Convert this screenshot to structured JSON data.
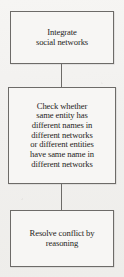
{
  "diagram": {
    "type": "flowchart",
    "orientation": "vertical",
    "background_color": "#f1f0ee",
    "border_color": "#6d6b68",
    "text_color": "#262423",
    "node_fill_color": "#f7f6f4",
    "nodes": [
      {
        "id": "integrate",
        "shape": "rectangle",
        "lines": [
          "Integrate",
          "social networks"
        ]
      },
      {
        "id": "check",
        "shape": "rectangle",
        "lines": [
          "Check whether",
          "same entity has",
          "different names in",
          "different networks",
          "or different entities",
          "have same name in",
          "different networks"
        ]
      },
      {
        "id": "resolve",
        "shape": "rectangle",
        "lines": [
          "Resolve conflict by",
          "reasoning"
        ]
      }
    ],
    "edges": [
      {
        "id": "integrate-to-check",
        "from": "integrate",
        "to": "check",
        "style": "solid-line"
      },
      {
        "id": "check-to-resolve",
        "from": "check",
        "to": "resolve",
        "style": "solid-line"
      }
    ]
  }
}
